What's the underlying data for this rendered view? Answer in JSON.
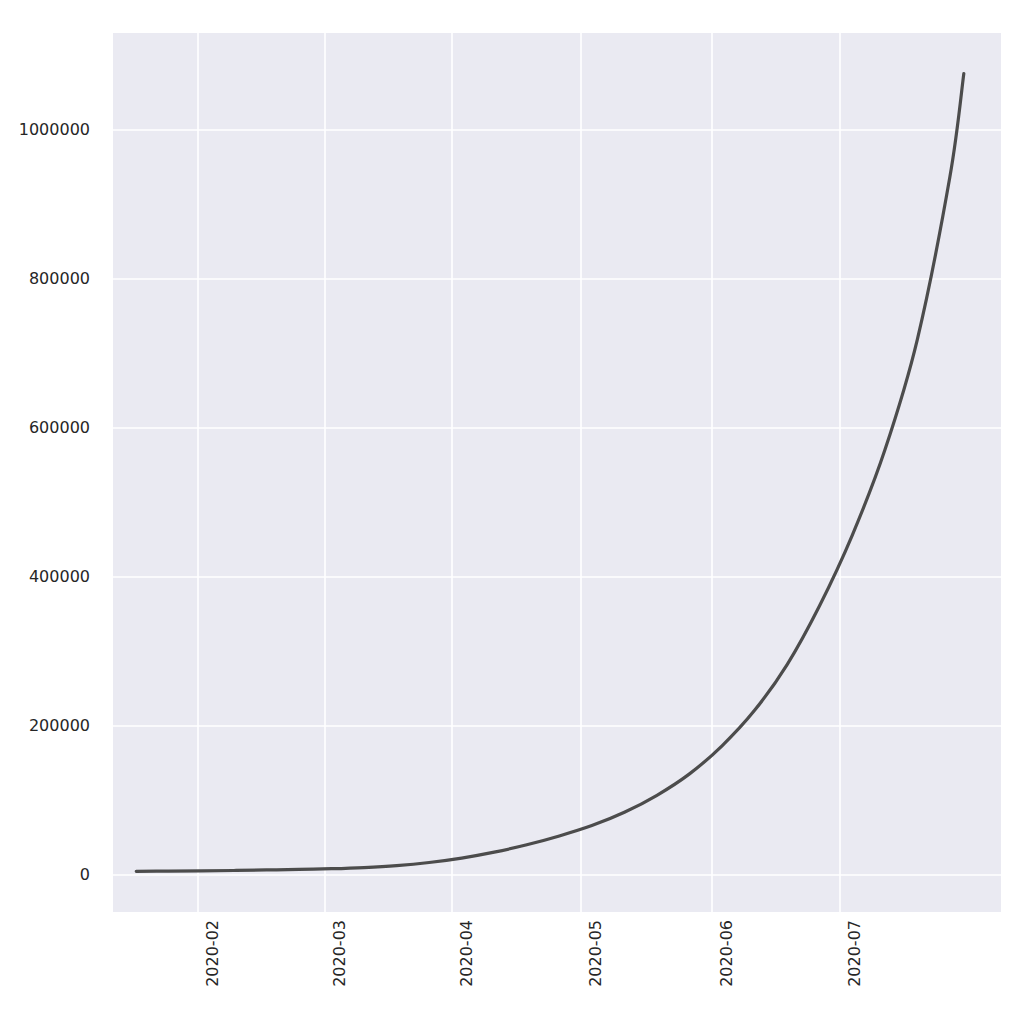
{
  "figure": {
    "width": 1017,
    "height": 1028,
    "facecolor": "#ffffff",
    "axes_facecolor": "#eaeaf2",
    "grid_color": "#ffffff",
    "line_color": "#4c4c4c",
    "tick_label_color": "#262626"
  },
  "chart_data": {
    "type": "line",
    "title": "",
    "xlabel": "",
    "ylabel": "",
    "grid": true,
    "legend": null,
    "xtick_labels": [
      "2020-02",
      "2020-03",
      "2020-04",
      "2020-05",
      "2020-06",
      "2020-07"
    ],
    "ytick_labels": [
      "0",
      "200000",
      "400000",
      "600000",
      "800000",
      "1000000"
    ],
    "ytick_values": [
      0,
      200000,
      400000,
      600000,
      800000,
      1000000
    ],
    "ylim": [
      -55000,
      1135000
    ],
    "xlim": [
      "2020-01-17",
      "2020-07-26"
    ],
    "series": [
      {
        "name": "cumulative total",
        "x": [
          "2020-01-22",
          "2020-01-29",
          "2020-02-05",
          "2020-02-12",
          "2020-02-19",
          "2020-02-26",
          "2020-03-04",
          "2020-03-11",
          "2020-03-18",
          "2020-03-25",
          "2020-04-01",
          "2020-04-08",
          "2020-04-15",
          "2020-04-22",
          "2020-04-29",
          "2020-05-06",
          "2020-05-13",
          "2020-05-20",
          "2020-05-27",
          "2020-06-03",
          "2020-06-10",
          "2020-06-17",
          "2020-06-24",
          "2020-07-01",
          "2020-07-08",
          "2020-07-15",
          "2020-07-18"
        ],
        "y": [
          100,
          300,
          700,
          1200,
          1900,
          2600,
          3600,
          5200,
          7800,
          12000,
          18000,
          26000,
          36000,
          48000,
          62000,
          80000,
          103000,
          132000,
          170000,
          218000,
          280000,
          360000,
          455000,
          570000,
          720000,
          940000,
          1080000
        ]
      }
    ]
  }
}
